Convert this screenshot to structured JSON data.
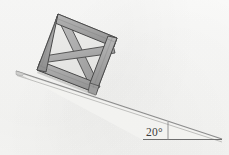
{
  "annotations": {
    "angle_label": "20°",
    "angle_value": 20,
    "angle_unit": "degrees"
  },
  "colors": {
    "background": "#f7f7f5",
    "plank_fill": "#a3a3a3",
    "plank_fill_light": "#b4b4b4",
    "plank_fill_dark": "#8f8f8f",
    "panel_fill": "#e8e8e6",
    "outline": "#4a4a4a",
    "ramp_fill": "#d8d8d6",
    "ramp_top": "#bdbdbb",
    "baseline": "#6e6e6e",
    "label_color": "#3c3c3c"
  },
  "geometry": {
    "incline_angle_deg": 20,
    "ramp": {
      "apex_left": [
        16,
        71
      ],
      "tip_right": [
        222,
        139
      ],
      "baseline_left": [
        143,
        139
      ],
      "baseline_right": [
        222,
        139
      ],
      "thickness": 6
    },
    "angle_marker": {
      "vertical_tick_x": 168,
      "vertical_tick_top": 122,
      "vertical_tick_bottom": 139,
      "label_pos": [
        146,
        136
      ]
    },
    "crate": {
      "corners": {
        "top_left": [
          58,
          14
        ],
        "top_right": [
          117,
          38
        ],
        "bottom_right": [
          96,
          93
        ],
        "bottom_left": [
          37,
          70
        ]
      },
      "frame_thickness": 9,
      "braces": [
        "diagonal-down",
        "diagonal-up",
        "vertical-mid"
      ]
    }
  }
}
